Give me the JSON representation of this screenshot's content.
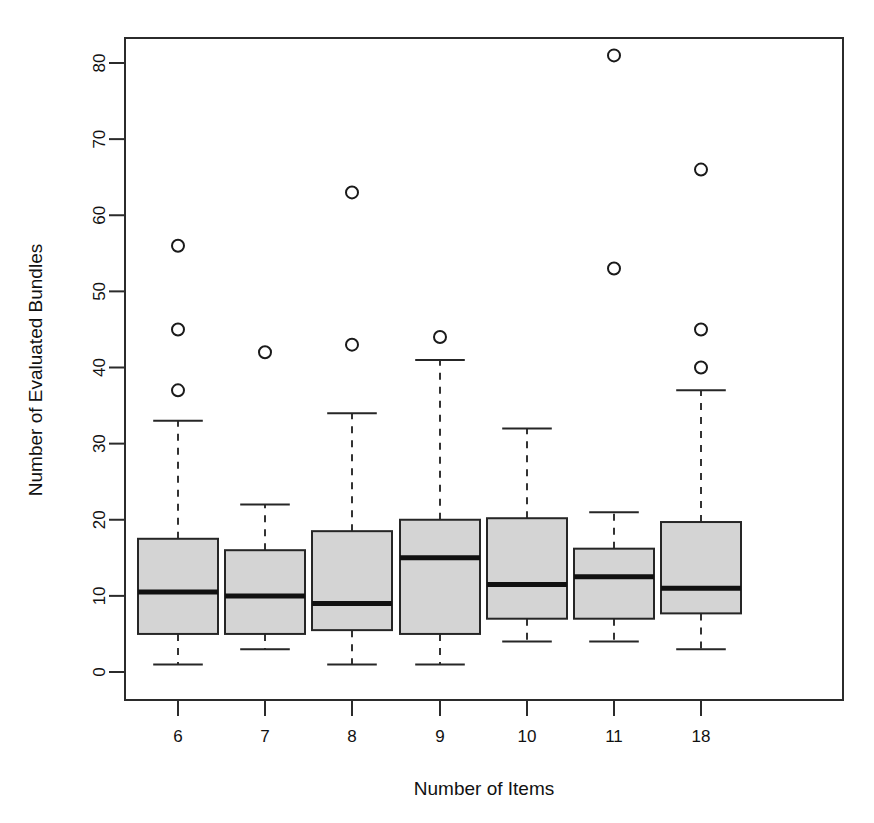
{
  "chart_data": {
    "type": "box",
    "title": "",
    "xlabel": "Number of Items",
    "ylabel": "Number of Evaluated Bundles",
    "xlim": [
      0,
      8
    ],
    "ylim": [
      0,
      84
    ],
    "grid": false,
    "legend": "none",
    "categories": [
      "6",
      "7",
      "8",
      "9",
      "10",
      "11",
      "18"
    ],
    "y_ticks": [
      0,
      10,
      20,
      30,
      40,
      50,
      60,
      70,
      80
    ],
    "y_tick_labels": [
      "0",
      "10",
      "20",
      "30",
      "40",
      "50",
      "60",
      "70",
      "80"
    ],
    "box_fill_color": "#d4d4d4",
    "line_color": "#262626",
    "boxes": [
      {
        "category": "6",
        "lower_whisker": 1,
        "q1": 5,
        "median": 10.5,
        "q3": 17.5,
        "upper_whisker": 33,
        "outliers": [
          37,
          45,
          56
        ]
      },
      {
        "category": "7",
        "lower_whisker": 3,
        "q1": 5,
        "median": 10,
        "q3": 16,
        "upper_whisker": 22,
        "outliers": [
          42
        ]
      },
      {
        "category": "8",
        "lower_whisker": 1,
        "q1": 5.5,
        "median": 9,
        "q3": 18.5,
        "upper_whisker": 34,
        "outliers": [
          43,
          63
        ]
      },
      {
        "category": "9",
        "lower_whisker": 1,
        "q1": 5,
        "median": 15,
        "q3": 20,
        "upper_whisker": 41,
        "outliers": [
          44
        ]
      },
      {
        "category": "10",
        "lower_whisker": 4,
        "q1": 7,
        "median": 11.5,
        "q3": 20.2,
        "upper_whisker": 32,
        "outliers": []
      },
      {
        "category": "11",
        "lower_whisker": 4,
        "q1": 7,
        "median": 12.5,
        "q3": 16.2,
        "upper_whisker": 21,
        "outliers": [
          53,
          81
        ]
      },
      {
        "category": "18",
        "lower_whisker": 3,
        "q1": 7.7,
        "median": 11,
        "q3": 19.7,
        "upper_whisker": 37,
        "outliers": [
          40,
          45,
          66
        ]
      }
    ]
  }
}
